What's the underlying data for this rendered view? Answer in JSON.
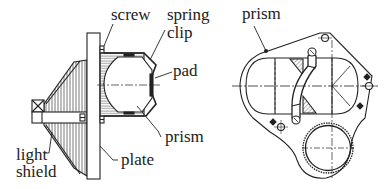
{
  "figure": {
    "colors": {
      "ink": "#222222",
      "background": "#ffffff",
      "hatch": "#555555"
    }
  },
  "left_view": {
    "name": "side-section",
    "labels": {
      "screw": "screw",
      "spring_clip_line1": "spring",
      "spring_clip_line2": "clip",
      "pad": "pad",
      "prism": "prism",
      "plate": "plate",
      "light_shield_line1": "light",
      "light_shield_line2": "shield"
    }
  },
  "right_view": {
    "name": "front-view",
    "labels": {
      "prism": "prism"
    }
  }
}
